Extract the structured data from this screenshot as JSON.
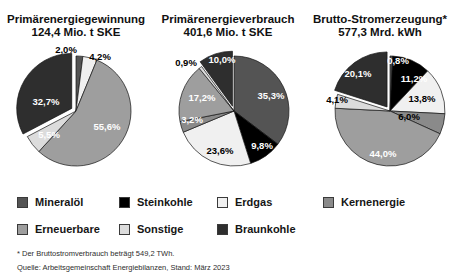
{
  "legend": {
    "items": [
      {
        "label": "Mineralöl",
        "color": "#545454"
      },
      {
        "label": "Steinkohle",
        "color": "#000000"
      },
      {
        "label": "Erdgas",
        "color": "#f0f0f0"
      },
      {
        "label": "Kernenergie",
        "color": "#8a8a8a"
      },
      {
        "label": "Erneuerbare",
        "color": "#9e9e9e"
      },
      {
        "label": "Sonstige",
        "color": "#dcdcdc"
      },
      {
        "label": "Braunkohle",
        "color": "#2e2e2e"
      }
    ]
  },
  "footnotes": [
    "* Der Bruttostromverbrauch beträgt 549,2 TWh.",
    "Quelle: Arbeitsgemeinschaft Energiebilanzen, Stand: März 2023"
  ],
  "chart_data": [
    {
      "type": "pie",
      "title": "Primärenergiegewinnung",
      "subtitle": "124,4 Mio. t SKE",
      "start_angle_deg": 0,
      "direction": "clockwise",
      "slices": [
        {
          "name": "Mineralöl",
          "value": 2.0,
          "label": "2,0%",
          "label_color": "#000000",
          "label_x": 66,
          "label_y": 12,
          "explode": false
        },
        {
          "name": "Erdgas",
          "value": 4.2,
          "label": "4,2%",
          "label_color": "#000000",
          "label_x": 100,
          "label_y": 19,
          "explode": false
        },
        {
          "name": "Erneuerbare",
          "value": 55.6,
          "label": "55,6%",
          "label_color": "#ffffff",
          "label_x": 107,
          "label_y": 89,
          "explode": false
        },
        {
          "name": "Sonstige",
          "value": 5.5,
          "label": "5,5%",
          "label_color": "#ffffff",
          "label_x": 49,
          "label_y": 97,
          "explode": false
        },
        {
          "name": "Braunkohle",
          "value": 32.7,
          "label": "32,7%",
          "label_color": "#ffffff",
          "label_x": 46,
          "label_y": 64,
          "explode": true
        }
      ]
    },
    {
      "type": "pie",
      "title": "Primärenergieverbrauch",
      "subtitle": "401,6 Mio. t SKE",
      "start_angle_deg": 0,
      "direction": "clockwise",
      "slices": [
        {
          "name": "Mineralöl",
          "value": 35.3,
          "label": "35,3%",
          "label_color": "#ffffff",
          "label_x": 119,
          "label_y": 58,
          "explode": false
        },
        {
          "name": "Steinkohle",
          "value": 9.8,
          "label": "9,8%",
          "label_color": "#ffffff",
          "label_x": 110,
          "label_y": 108,
          "explode": false
        },
        {
          "name": "Erdgas",
          "value": 23.6,
          "label": "23,6%",
          "label_color": "#000000",
          "label_x": 68,
          "label_y": 113,
          "explode": false
        },
        {
          "name": "Kernenergie",
          "value": 3.2,
          "label": "3,2%",
          "label_color": "#ffffff",
          "label_x": 40,
          "label_y": 82,
          "explode": false
        },
        {
          "name": "Erneuerbare",
          "value": 17.2,
          "label": "17,2%",
          "label_color": "#ffffff",
          "label_x": 50,
          "label_y": 60,
          "explode": false
        },
        {
          "name": "Sonstige",
          "value": 0.9,
          "label": "0,9%",
          "label_color": "#000000",
          "label_x": 34,
          "label_y": 25,
          "explode": false
        },
        {
          "name": "Braunkohle",
          "value": 10.0,
          "label": "10,0%",
          "label_color": "#ffffff",
          "label_x": 70,
          "label_y": 22,
          "explode": true
        }
      ]
    },
    {
      "type": "pie",
      "title": "Brutto-Stromerzeugung*",
      "subtitle": "577,3 Mrd. kWh",
      "start_angle_deg": 0,
      "direction": "clockwise",
      "slices": [
        {
          "name": "Mineralöl",
          "value": 0.8,
          "label": "0,8%",
          "label_color": "#ffffff",
          "label_x": 94,
          "label_y": 23,
          "explode": false
        },
        {
          "name": "Steinkohle",
          "value": 11.2,
          "label": "11,2%",
          "label_color": "#ffffff",
          "label_x": 110,
          "label_y": 41,
          "explode": false
        },
        {
          "name": "Erdgas",
          "value": 13.8,
          "label": "13,8%",
          "label_color": "#000000",
          "label_x": 118,
          "label_y": 61,
          "explode": false
        },
        {
          "name": "Kernenergie",
          "value": 6.0,
          "label": "6,0%",
          "label_color": "#000000",
          "label_x": 105,
          "label_y": 79,
          "explode": false
        },
        {
          "name": "Erneuerbare",
          "value": 44.0,
          "label": "44,0%",
          "label_color": "#ffffff",
          "label_x": 79,
          "label_y": 116,
          "explode": false
        },
        {
          "name": "Sonstige",
          "value": 4.1,
          "label": "4,1%",
          "label_color": "#000000",
          "label_x": 33,
          "label_y": 62,
          "explode": false
        },
        {
          "name": "Braunkohle",
          "value": 20.1,
          "label": "20,1%",
          "label_color": "#ffffff",
          "label_x": 54,
          "label_y": 36,
          "explode": true
        }
      ]
    }
  ]
}
